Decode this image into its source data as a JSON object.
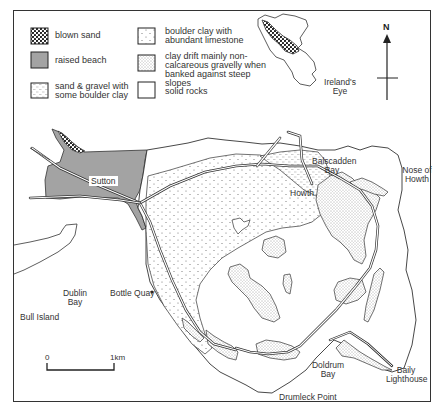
{
  "legend": {
    "items": [
      {
        "id": "blown-sand",
        "label": "blown sand",
        "pattern": "dense-dots"
      },
      {
        "id": "raised-beach",
        "label": "raised beach",
        "pattern": "solid-grey"
      },
      {
        "id": "sand-gravel",
        "label": "sand & gravel with some boulder clay",
        "pattern": "dash-lines"
      },
      {
        "id": "boulder-clay-limestone",
        "label": "boulder clay with abundant limestone",
        "pattern": "sparse-dots"
      },
      {
        "id": "clay-drift",
        "label": "clay drift mainly non-calcareous gravelly when banked against steep slopes",
        "pattern": "fine-stipple"
      },
      {
        "id": "solid-rocks",
        "label": "solid rocks",
        "pattern": "blank"
      }
    ]
  },
  "compass": {
    "north_label": "N"
  },
  "scale": {
    "start_label": "0",
    "end_label": "1km"
  },
  "places": {
    "irelands_eye": "Ireland's Eye",
    "sutton": "Sutton",
    "balscadden_bay": "Balscadden Bay",
    "nose_of_howth": "Nose of Howth",
    "howth": "Howth",
    "bull_island": "Bull Island",
    "dublin_bay": "Dublin Bay",
    "bottle_quay": "Bottle Quay",
    "doldrum_bay": "Doldrum Bay",
    "baily_lighthouse": "Baily Lighthouse",
    "drumleck_point": "Drumleck Point"
  },
  "colors": {
    "raised_beach": "#a3a3a3",
    "outline": "#333333",
    "background": "#ffffff"
  }
}
